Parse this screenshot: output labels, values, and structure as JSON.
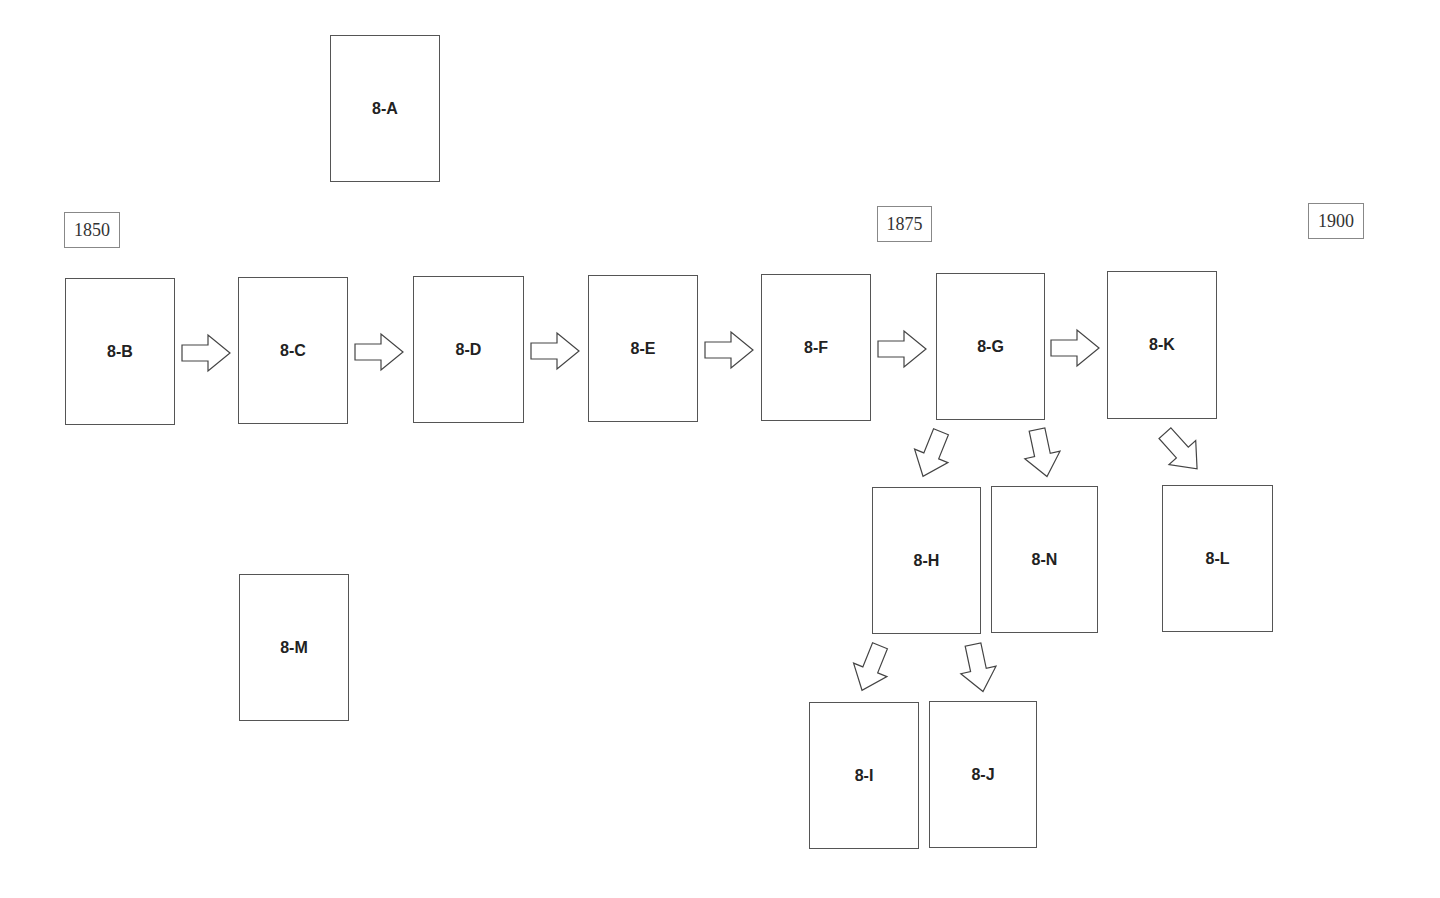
{
  "years": [
    {
      "label": "1850",
      "x": 64,
      "y": 212,
      "w": 56,
      "h": 36
    },
    {
      "label": "1875",
      "x": 877,
      "y": 206,
      "w": 55,
      "h": 36
    },
    {
      "label": "1900",
      "x": 1308,
      "y": 203,
      "w": 56,
      "h": 36
    }
  ],
  "boxes": [
    {
      "id": "8-A",
      "label": "8-A",
      "x": 330,
      "y": 35,
      "w": 110,
      "h": 147
    },
    {
      "id": "8-B",
      "label": "8-B",
      "x": 65,
      "y": 278,
      "w": 110,
      "h": 147
    },
    {
      "id": "8-C",
      "label": "8-C",
      "x": 238,
      "y": 277,
      "w": 110,
      "h": 147
    },
    {
      "id": "8-D",
      "label": "8-D",
      "x": 413,
      "y": 276,
      "w": 111,
      "h": 147
    },
    {
      "id": "8-E",
      "label": "8-E",
      "x": 588,
      "y": 275,
      "w": 110,
      "h": 147
    },
    {
      "id": "8-F",
      "label": "8-F",
      "x": 761,
      "y": 274,
      "w": 110,
      "h": 147
    },
    {
      "id": "8-G",
      "label": "8-G",
      "x": 936,
      "y": 273,
      "w": 109,
      "h": 147
    },
    {
      "id": "8-K",
      "label": "8-K",
      "x": 1107,
      "y": 271,
      "w": 110,
      "h": 148
    },
    {
      "id": "8-H",
      "label": "8-H",
      "x": 872,
      "y": 487,
      "w": 109,
      "h": 147
    },
    {
      "id": "8-N",
      "label": "8-N",
      "x": 991,
      "y": 486,
      "w": 107,
      "h": 147
    },
    {
      "id": "8-L",
      "label": "8-L",
      "x": 1162,
      "y": 485,
      "w": 111,
      "h": 147
    },
    {
      "id": "8-M",
      "label": "8-M",
      "x": 239,
      "y": 574,
      "w": 110,
      "h": 147
    },
    {
      "id": "8-I",
      "label": "8-I",
      "x": 809,
      "y": 702,
      "w": 110,
      "h": 147
    },
    {
      "id": "8-J",
      "label": "8-J",
      "x": 929,
      "y": 701,
      "w": 108,
      "h": 147
    }
  ],
  "arrows": [
    {
      "from": "8-B",
      "to": "8-C",
      "cx": 206,
      "cy": 353,
      "angle": 0
    },
    {
      "from": "8-C",
      "to": "8-D",
      "cx": 379,
      "cy": 352,
      "angle": 0
    },
    {
      "from": "8-D",
      "to": "8-E",
      "cx": 555,
      "cy": 351,
      "angle": 0
    },
    {
      "from": "8-E",
      "to": "8-F",
      "cx": 729,
      "cy": 350,
      "angle": 0
    },
    {
      "from": "8-F",
      "to": "8-G",
      "cx": 902,
      "cy": 349,
      "angle": 0
    },
    {
      "from": "8-G",
      "to": "8-K",
      "cx": 1075,
      "cy": 348,
      "angle": 0
    },
    {
      "from": "8-G",
      "to": "8-H",
      "cx": 932,
      "cy": 454,
      "angle": 112
    },
    {
      "from": "8-G",
      "to": "8-N",
      "cx": 1042,
      "cy": 453,
      "angle": 78
    },
    {
      "from": "8-K",
      "to": "8-L",
      "cx": 1181,
      "cy": 451,
      "angle": 48
    },
    {
      "from": "8-H",
      "to": "8-I",
      "cx": 871,
      "cy": 668,
      "angle": 112
    },
    {
      "from": "8-H",
      "to": "8-J",
      "cx": 978,
      "cy": 668,
      "angle": 78
    }
  ]
}
